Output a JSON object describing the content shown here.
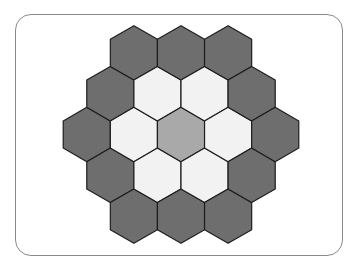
{
  "diagram": {
    "type": "hexagonal-grid",
    "orientation": "pointy-top",
    "rings": [
      {
        "ring": 0,
        "count": 1,
        "fill": "#a9a9a9",
        "label": "center"
      },
      {
        "ring": 1,
        "count": 6,
        "fill": "#f2f2f2",
        "label": "inner ring"
      },
      {
        "ring": 2,
        "count": 12,
        "fill": "#6e6e6e",
        "label": "outer ring"
      }
    ],
    "stroke": "#1e1e1e",
    "frame_stroke": "#8a8a8a"
  }
}
